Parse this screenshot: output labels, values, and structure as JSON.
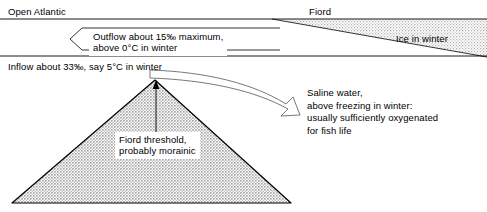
{
  "diagram": {
    "background_color": "#ffffff",
    "line_color": "#000000",
    "fill_color": "#d9d9d9",
    "width": 487,
    "height": 212
  },
  "labels": {
    "open_atlantic": "Open Atlantic",
    "fiord": "Fiord",
    "ice_in_winter": "Ice in winter",
    "outflow_line1": "Outflow about 15‰ maximum,",
    "outflow_line2": "above 0°C in winter",
    "inflow": "Inflow about 33‰, say 5°C in winter",
    "threshold_line1": "Fiord threshold,",
    "threshold_line2": "probably morainic",
    "saline_line1": "Saline water,",
    "saline_line2": "above freezing in winter:",
    "saline_line3": "usually sufficiently oxygenated",
    "saline_line4": "for fish life"
  },
  "icons": {
    "outflow_arrow": "left-arrow-icon",
    "inflow_curve_arrow": "curved-right-arrow-icon",
    "threshold_pointer": "up-arrow-icon"
  },
  "values": {
    "outflow_salinity": "15‰",
    "outflow_temperature": "0°C",
    "inflow_salinity": "33‰",
    "inflow_temperature": "5°C"
  }
}
